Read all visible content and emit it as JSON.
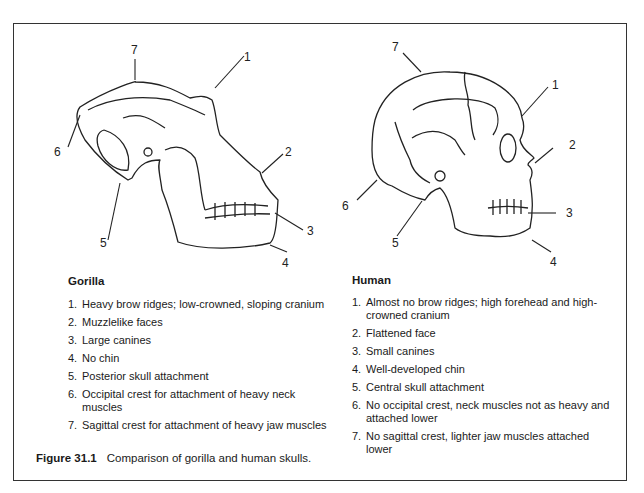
{
  "figure": {
    "number": "Figure 31.1",
    "caption": "Comparison of gorilla and human skulls."
  },
  "gorilla": {
    "heading": "Gorilla",
    "callouts": [
      "7",
      "1",
      "6",
      "2",
      "3",
      "5",
      "4"
    ],
    "items": [
      {
        "num": "1.",
        "text": "Heavy brow ridges; low-crowned, sloping cranium"
      },
      {
        "num": "2.",
        "text": "Muzzlelike faces"
      },
      {
        "num": "3.",
        "text": "Large canines"
      },
      {
        "num": "4.",
        "text": "No chin"
      },
      {
        "num": "5.",
        "text": "Posterior skull attachment"
      },
      {
        "num": "6.",
        "text": "Occipital crest for attachment of heavy neck muscles"
      },
      {
        "num": "7.",
        "text": "Sagittal crest for attachment of heavy jaw muscles"
      }
    ]
  },
  "human": {
    "heading": "Human",
    "callouts": [
      "7",
      "1",
      "2",
      "6",
      "3",
      "5",
      "4"
    ],
    "items": [
      {
        "num": "1.",
        "text": "Almost no brow ridges; high forehead and high-crowned cranium"
      },
      {
        "num": "2.",
        "text": "Flattened face"
      },
      {
        "num": "3.",
        "text": "Small canines"
      },
      {
        "num": "4.",
        "text": "Well-developed chin"
      },
      {
        "num": "5.",
        "text": "Central skull attachment"
      },
      {
        "num": "6.",
        "text": "No occipital crest, neck muscles not as heavy and attached lower"
      },
      {
        "num": "7.",
        "text": "No sagittal crest, lighter jaw muscles attached lower"
      }
    ]
  }
}
